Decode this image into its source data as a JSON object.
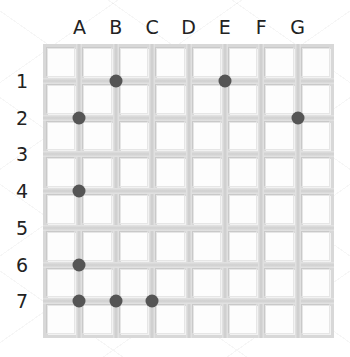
{
  "grid": {
    "columns": [
      "A",
      "B",
      "C",
      "D",
      "E",
      "F",
      "G"
    ],
    "rows": [
      "1",
      "2",
      "3",
      "4",
      "5",
      "6",
      "7"
    ],
    "dot_color": "#555555",
    "dots": [
      {
        "col": "B",
        "row": "1"
      },
      {
        "col": "E",
        "row": "1"
      },
      {
        "col": "A",
        "row": "2"
      },
      {
        "col": "G",
        "row": "2"
      },
      {
        "col": "A",
        "row": "4"
      },
      {
        "col": "A",
        "row": "6"
      },
      {
        "col": "A",
        "row": "7"
      },
      {
        "col": "B",
        "row": "7"
      },
      {
        "col": "C",
        "row": "7"
      }
    ]
  }
}
